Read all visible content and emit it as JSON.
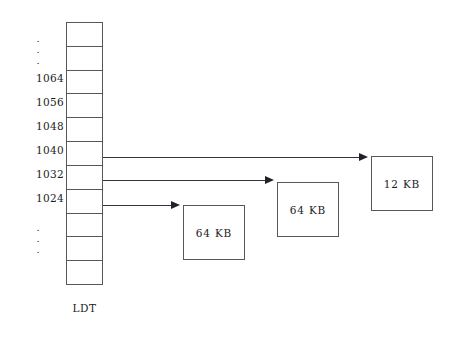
{
  "diagram": {
    "background_color": "#ffffff",
    "line_color": "#55585c"
  },
  "ldt": {
    "caption": "LDT",
    "cell_count": 11,
    "cells": [
      {
        "index": 0,
        "address": ""
      },
      {
        "index": 1,
        "address": ""
      },
      {
        "index": 2,
        "address": "1064"
      },
      {
        "index": 3,
        "address": "1056"
      },
      {
        "index": 4,
        "address": "1048"
      },
      {
        "index": 5,
        "address": "1040"
      },
      {
        "index": 6,
        "address": "1032"
      },
      {
        "index": 7,
        "address": "1024"
      },
      {
        "index": 8,
        "address": ""
      },
      {
        "index": 9,
        "address": ""
      },
      {
        "index": 10,
        "address": ""
      }
    ]
  },
  "address_labels": [
    {
      "text": "1064",
      "top": 72
    },
    {
      "text": "1056",
      "top": 96
    },
    {
      "text": "1048",
      "top": 120
    },
    {
      "text": "1040",
      "top": 144
    },
    {
      "text": "1032",
      "top": 168
    },
    {
      "text": "1024",
      "top": 192
    }
  ],
  "ellipsis_top": {
    "dots": [
      "."
    ]
  },
  "ellipsis_bottom": {
    "dots": [
      "."
    ]
  },
  "segments": [
    {
      "id": "segment-1",
      "label": "64 KB",
      "source_address": "1024",
      "left": 183,
      "top": 205,
      "width": 62,
      "height": 55
    },
    {
      "id": "segment-2",
      "label": "64 KB",
      "source_address": "1032",
      "left": 277,
      "top": 182,
      "width": 62,
      "height": 55
    },
    {
      "id": "segment-3",
      "label": "12 KB",
      "source_address": "1040",
      "left": 371,
      "top": 156,
      "width": 62,
      "height": 55
    }
  ],
  "arrows": [
    {
      "id": "arrow-1040",
      "from": "1040",
      "to": "segment-3",
      "y": 157,
      "x_start": 103,
      "x_end": 362
    },
    {
      "id": "arrow-1032",
      "from": "1032",
      "to": "segment-2",
      "y": 180,
      "x_start": 103,
      "x_end": 268
    },
    {
      "id": "arrow-1024",
      "from": "1024",
      "to": "segment-1",
      "y": 205,
      "x_start": 103,
      "x_end": 174
    }
  ]
}
